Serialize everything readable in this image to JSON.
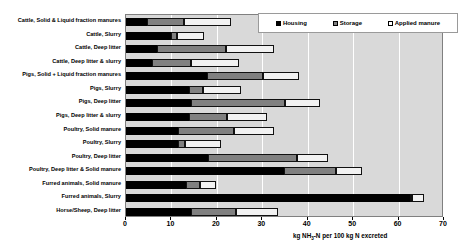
{
  "chart_data": {
    "type": "bar",
    "orientation": "horizontal",
    "stacked": true,
    "title": "",
    "xlabel": "kg NH3-N per 100 kg N excreted",
    "ylabel": "",
    "xlim": [
      0,
      70
    ],
    "xticks": [
      0,
      10,
      20,
      30,
      40,
      50,
      60,
      70
    ],
    "grid": true,
    "legend_position": "top-right",
    "categories": [
      "Cattle, Solid & Liquid fraction manures",
      "Cattle, Slurry",
      "Cattle, Deep litter",
      "Cattle, Deep litter & slurry",
      "Pigs, Solid + Liquid fraction manures",
      "Pigs, Slurry",
      "Pigs, Deep litter",
      "Pigs, Deep litter & slurry",
      "Poultry, Solid manure",
      "Poultry, Slurry",
      "Poultry, Deep litter",
      "Poultry, Deep litter & Solid manure",
      "Furred animals, Solid manure",
      "Furred animals, Slurry",
      "Horse/Sheep, Deep litter"
    ],
    "series": [
      {
        "name": "Housing",
        "color": "#000000",
        "values": [
          4.6,
          10.0,
          6.8,
          5.7,
          17.8,
          13.9,
          14.4,
          13.9,
          11.5,
          11.5,
          18.1,
          34.7,
          13.2,
          62.6,
          14.2
        ]
      },
      {
        "name": "Storage",
        "color": "#808080",
        "values": [
          8.2,
          1.2,
          15.2,
          8.6,
          12.3,
          3.0,
          20.6,
          8.3,
          12.3,
          1.5,
          19.5,
          11.5,
          3.1,
          0.4,
          10.0
        ]
      },
      {
        "name": "Applied manure",
        "color": "#F2F2F2",
        "values": [
          10.3,
          6.0,
          10.6,
          10.6,
          7.9,
          8.4,
          7.8,
          8.8,
          8.7,
          8.0,
          6.8,
          5.7,
          3.5,
          2.6,
          9.3
        ]
      }
    ],
    "totals": [
      23.1,
      17.2,
      32.6,
      24.9,
      38.0,
      25.3,
      42.8,
      31.0,
      32.5,
      21.0,
      44.4,
      51.9,
      19.8,
      65.6,
      33.5
    ]
  },
  "legend": {
    "items": [
      {
        "label": "Housing",
        "swatch": "housing-swatch-icon"
      },
      {
        "label": "Storage",
        "swatch": "storage-swatch-icon"
      },
      {
        "label": "Applied manure",
        "swatch": "applied-manure-swatch-icon"
      }
    ]
  },
  "axis": {
    "title_prefix": "kg NH",
    "title_sub": "3",
    "title_suffix": "-N per 100 kg N excreted",
    "tick_labels": [
      "0",
      "10",
      "20",
      "30",
      "40",
      "50",
      "60",
      "70"
    ]
  },
  "colors": {
    "plot_background": "#D9D9D9",
    "gridline": "#FFFFFF",
    "housing": "#000000",
    "storage": "#808080",
    "applied": "#F2F2F2",
    "border": "#808080",
    "text": "#000000"
  }
}
